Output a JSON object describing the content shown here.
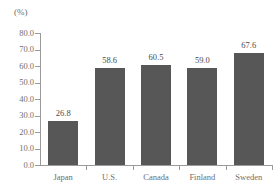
{
  "chart_data": {
    "type": "bar",
    "title": "",
    "subtitle": "",
    "xlabel": "",
    "ylabel": "",
    "unit_label": "(%)",
    "categories": [
      "Japan",
      "U.S.",
      "Canada",
      "Finland",
      "Sweden"
    ],
    "values": [
      26.8,
      58.6,
      60.5,
      59.0,
      67.6
    ],
    "value_labels": [
      "26.8",
      "58.6",
      "60.5",
      "59.0",
      "67.6"
    ],
    "ylim": [
      0.0,
      80.0
    ],
    "ytick_labels": [
      "80.0",
      "70.0",
      "60.0",
      "50.0",
      "40.0",
      "30.0",
      "20.0",
      "10.0",
      "0.0"
    ],
    "ytick_values": [
      80.0,
      70.0,
      60.0,
      50.0,
      40.0,
      30.0,
      20.0,
      10.0,
      0.0
    ],
    "grid": false,
    "legend": false,
    "legend_position": "none",
    "bar_color": "#575757",
    "axis_color": "#9a9a9a",
    "text_color": "#6f6f6f",
    "background_color": "#ffffff"
  }
}
